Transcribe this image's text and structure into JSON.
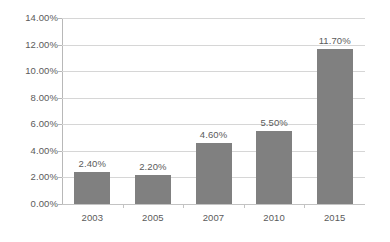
{
  "chart_data": {
    "type": "bar",
    "title": "",
    "subtitle": "",
    "xlabel": "",
    "ylabel": "",
    "categories": [
      "2003",
      "2005",
      "2007",
      "2010",
      "2015"
    ],
    "values": [
      2.4,
      2.2,
      4.6,
      5.5,
      11.7
    ],
    "value_labels": [
      "2.40%",
      "2.20%",
      "4.60%",
      "5.50%",
      "11.70%"
    ],
    "ylim": [
      0,
      14
    ],
    "ytick_values": [
      0,
      2,
      4,
      6,
      8,
      10,
      12,
      14
    ],
    "ytick_labels": [
      "0.00%",
      "2.00%",
      "4.00%",
      "6.00%",
      "8.00%",
      "10.00%",
      "12.00%",
      "14.00%"
    ],
    "grid": true,
    "legend": false,
    "legend_position": "none",
    "series": [
      {
        "name": "",
        "values": [
          2.4,
          2.2,
          4.6,
          5.5,
          11.7
        ],
        "color": "#808080"
      }
    ],
    "colors": {
      "bar": "#808080",
      "gridline": "#d6d6d6",
      "axis": "#b8b8b8",
      "text": "#5b5b5b",
      "background": "#ffffff"
    }
  }
}
